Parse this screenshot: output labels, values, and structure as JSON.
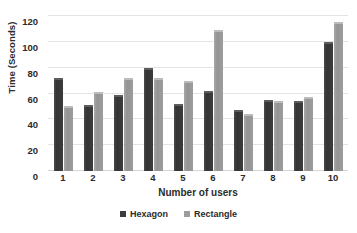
{
  "chart_data": {
    "type": "bar",
    "title": "",
    "xlabel": "Number of users",
    "ylabel": "Time (Seconds)",
    "categories": [
      "1",
      "2",
      "3",
      "4",
      "5",
      "6",
      "7",
      "8",
      "9",
      "10"
    ],
    "series": [
      {
        "name": "Hexagon",
        "color": "#3c3c3c",
        "values": [
          72,
          51,
          59,
          80,
          52,
          62,
          47,
          55,
          54,
          100
        ]
      },
      {
        "name": "Rectangle",
        "color": "#9d9d9d",
        "values": [
          50,
          61,
          72,
          72,
          70,
          109,
          44,
          54,
          57,
          115
        ]
      }
    ],
    "ylim": [
      0,
      120
    ],
    "yticks": [
      0,
      20,
      40,
      60,
      80,
      100,
      120
    ],
    "grid": true,
    "legend_position": "bottom"
  }
}
